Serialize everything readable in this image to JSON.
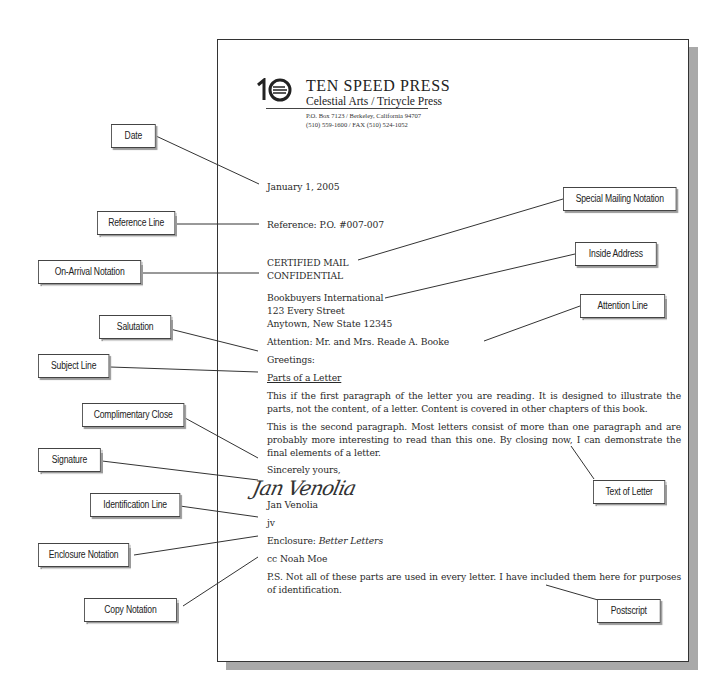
{
  "letterhead": {
    "logo_icon": "ten-speed-press-logo",
    "company_name": "TEN SPEED PRESS",
    "imprints": "Celestial Arts / Tricycle Press",
    "address_line": "P.O. Box 7123 / Berkeley, California 94707",
    "phone_line": "(510) 559-1600 / FAX (510) 524-1052"
  },
  "letter": {
    "date": "January 1, 2005",
    "reference": "Reference: P.O. #007-007",
    "special_mailing": "CERTIFIED MAIL",
    "on_arrival": "CONFIDENTIAL",
    "inside_address": [
      "Bookbuyers International",
      "123 Every Street",
      "Anytown, New State 12345"
    ],
    "attention": "Attention: Mr. and Mrs. Reade A. Booke",
    "salutation": "Greetings:",
    "subject": "Parts of a Letter",
    "paragraph1": "This if the first paragraph of the letter you are reading. It is designed to illustrate the parts, not the content, of a letter. Content is covered in other chapters of this book.",
    "paragraph2": "This is the second paragraph. Most letters consist of more than one paragraph and are probably more interesting to read than this one. By closing now, I can demonstrate the final elements of a letter.",
    "complimentary_close": "Sincerely yours,",
    "signature_script": "Jan Venolia",
    "signer_name": "Jan Venolia",
    "identification": "jv",
    "enclosure_prefix": "Enclosure: ",
    "enclosure_title": "Better Letters",
    "copy": "cc Noah Moe",
    "postscript": "P.S. Not all of these parts are used in every letter. I have included them here for purposes of identification."
  },
  "labels": {
    "date": "Date",
    "reference_line": "Reference Line",
    "on_arrival_notation": "On-Arrival Notation",
    "salutation": "Salutation",
    "subject_line": "Subject Line",
    "complimentary_close": "Complimentary Close",
    "signature": "Signature",
    "identification_line": "Identification Line",
    "enclosure_notation": "Enclosure Notation",
    "copy_notation": "Copy Notation",
    "special_mailing_notation": "Special Mailing Notation",
    "inside_address": "Inside Address",
    "attention_line": "Attention Line",
    "text_of_letter": "Text of Letter",
    "postscript": "Postscript"
  }
}
